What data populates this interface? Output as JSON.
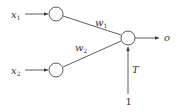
{
  "diagram": {
    "type": "perceptron",
    "inputs": [
      {
        "label": "x",
        "subscript": "1"
      },
      {
        "label": "x",
        "subscript": "2"
      }
    ],
    "weights": [
      {
        "label": "w",
        "subscript": "1"
      },
      {
        "label": "w",
        "subscript": "2"
      }
    ],
    "output": {
      "label": "o"
    },
    "threshold": {
      "label": "T"
    },
    "bias_input": {
      "label": "1"
    },
    "colors": {
      "stroke": "#333333",
      "background": "#ffffff"
    }
  }
}
